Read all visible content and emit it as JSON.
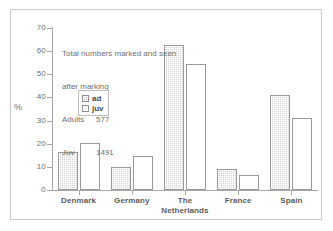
{
  "chart_data": {
    "type": "bar",
    "title": "",
    "xlabel": "",
    "ylabel": "%",
    "ylim": [
      0,
      70
    ],
    "yticks": [
      0,
      10,
      20,
      30,
      40,
      50,
      60,
      70
    ],
    "grid": false,
    "legend_position": "inside-left",
    "categories": [
      "Denmark",
      "Germany",
      "The Netherlands",
      "France",
      "Spain"
    ],
    "series": [
      {
        "name": "ad",
        "values": [
          16.5,
          9.8,
          62.8,
          9.0,
          41.0
        ]
      },
      {
        "name": "juv",
        "values": [
          20.5,
          14.8,
          54.5,
          6.3,
          31.3
        ]
      }
    ],
    "annotations": {
      "line1": "Total numbers marked and seen",
      "line2": "after marking",
      "adults_label": "Adults",
      "adults_value": "577",
      "juv_label": "Juv",
      "juv_value": "1491"
    },
    "colors": {
      "ad_fill": "#d2d2d2",
      "juv_fill": "#ffffff",
      "bar_outline": "#9a9a9a",
      "axis": "#a8a8a8",
      "text": "#6f6f6f",
      "label_text": "#5c5c5c",
      "frame": "#c9c9c9",
      "background": "#ffffff"
    }
  },
  "axis": {
    "y_title": "%",
    "tick_labels": [
      "70",
      "60",
      "50",
      "40",
      "30",
      "20",
      "10",
      "0"
    ]
  },
  "legend": {
    "items": [
      {
        "label": "ad"
      },
      {
        "label": "juv"
      }
    ]
  },
  "xaxis": {
    "labels": [
      {
        "line1": "Denmark",
        "line2": ""
      },
      {
        "line1": "Germany",
        "line2": ""
      },
      {
        "line1": "The",
        "line2": "Netherlands"
      },
      {
        "line1": "France",
        "line2": ""
      },
      {
        "line1": "Spain",
        "line2": ""
      }
    ]
  }
}
